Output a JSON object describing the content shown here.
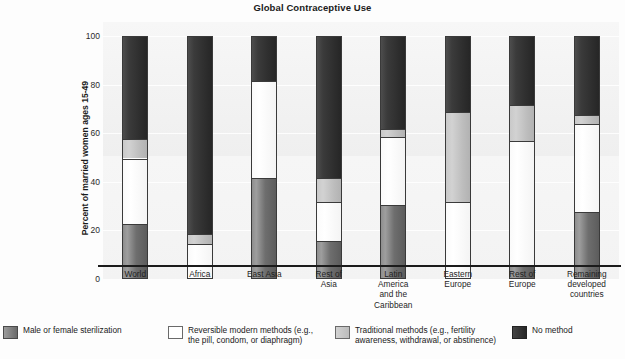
{
  "chart_data": {
    "type": "bar",
    "stacked": true,
    "title": "Global Contraceptive Use",
    "xlabel": "",
    "ylabel": "Percent of married women ages 15-49",
    "ylim": [
      0,
      100
    ],
    "yticks": [
      0,
      20,
      40,
      60,
      80,
      100
    ],
    "ytick_labels": [
      "0",
      "20",
      "40",
      "60",
      "80",
      "100"
    ],
    "grid": true,
    "legend_position": "bottom",
    "categories": [
      "World",
      "Africa",
      "East Asia",
      "Rest of\nAsia",
      "Latin\nAmerica\nand the\nCaribbean",
      "Eastern\nEurope",
      "Rest of\nEurope",
      "Remaining\ndeveloped\ncountries"
    ],
    "series": [
      {
        "name": "Male or female sterilization",
        "color": "#6e6e6e",
        "values": [
          23,
          1,
          42,
          16,
          31,
          0,
          6,
          28
        ]
      },
      {
        "name": "Reversible modern methods (e.g., the pill, condom, or diaphragm)",
        "color": "#ffffff",
        "values": [
          27,
          14,
          40,
          16,
          28,
          32,
          51,
          36
        ]
      },
      {
        "name": "Traditional methods (e.g., fertility awareness, withdrawal, or abstinence)",
        "color": "#c6c6c6",
        "values": [
          8,
          4,
          0,
          10,
          3,
          37,
          15,
          4
        ]
      },
      {
        "name": "No method",
        "color": "#2e2e2e",
        "values": [
          42,
          81,
          18,
          58,
          38,
          31,
          28,
          32
        ]
      }
    ]
  },
  "legend": {
    "items": [
      {
        "swatch": "ster",
        "label": "Male or female sterilization"
      },
      {
        "swatch": "rev",
        "label": "Reversible modern methods (e.g., the pill, condom, or diaphragm)"
      },
      {
        "swatch": "trad",
        "label": "Traditional methods (e.g., fertility awareness, withdrawal, or abstinence)"
      },
      {
        "swatch": "none",
        "label": "No method"
      }
    ]
  }
}
